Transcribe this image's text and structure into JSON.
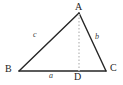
{
  "figure": {
    "kind": "triangle-with-altitude-diagram",
    "background_color": "#ffffff",
    "stroke_color": "#262626",
    "altitude_color": "#c8c8c8",
    "vertices": {
      "A": {
        "label": "A",
        "x": 79,
        "y": 13
      },
      "B": {
        "label": "B",
        "x": 19,
        "y": 71
      },
      "C": {
        "label": "C",
        "x": 106,
        "y": 71
      },
      "D": {
        "label": "D",
        "x": 79,
        "y": 71
      }
    },
    "sides": [
      {
        "name": "AB",
        "label": "c"
      },
      {
        "name": "AC",
        "label": "b"
      },
      {
        "name": "BC",
        "label": "a"
      }
    ],
    "altitude": {
      "from": "A",
      "to": "D",
      "style": "dotted"
    }
  }
}
